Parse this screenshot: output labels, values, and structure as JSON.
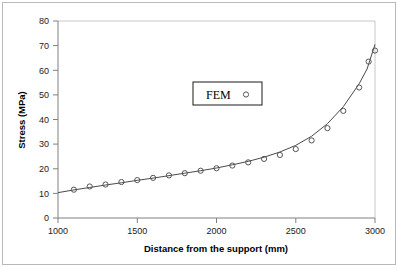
{
  "chart_data": {
    "type": "scatter",
    "title": "",
    "xlabel": "Distance from the support (mm)",
    "ylabel": "Stress (MPa)",
    "xlim": [
      1000,
      3000
    ],
    "ylim": [
      0,
      80
    ],
    "xticks": [
      1000,
      1500,
      2000,
      2500,
      3000
    ],
    "yticks": [
      0,
      10,
      20,
      30,
      40,
      50,
      60,
      70,
      80
    ],
    "xtick_labels": [
      "1000",
      "1500",
      "2000",
      "2500",
      "3000"
    ],
    "ytick_labels": [
      "0",
      "10",
      "20",
      "30",
      "40",
      "50",
      "60",
      "70",
      "80"
    ],
    "grid": false,
    "legend": {
      "position": "upper-center",
      "entries": [
        {
          "label": "FEM",
          "marker": "open-circle"
        }
      ]
    },
    "series": [
      {
        "name": "FEM",
        "marker": "open-circle",
        "x": [
          1100,
          1200,
          1300,
          1400,
          1500,
          1600,
          1700,
          1800,
          1900,
          2000,
          2100,
          2200,
          2300,
          2400,
          2500,
          2600,
          2700,
          2800,
          2900,
          2960,
          3000
        ],
        "y": [
          11.5,
          12.8,
          13.6,
          14.6,
          15.4,
          16.3,
          17.3,
          18.2,
          19.2,
          20.2,
          21.3,
          22.6,
          24.0,
          25.6,
          28.0,
          31.5,
          36.5,
          43.5,
          53.0,
          63.5,
          68.0
        ]
      },
      {
        "name": "fitted-curve",
        "marker": "none",
        "x": [
          1000,
          1100,
          1200,
          1300,
          1400,
          1500,
          1600,
          1700,
          1800,
          1900,
          2000,
          2100,
          2200,
          2300,
          2400,
          2500,
          2600,
          2700,
          2800,
          2900,
          2950,
          3000
        ],
        "y": [
          10.3,
          11.4,
          12.4,
          13.4,
          14.3,
          15.3,
          16.2,
          17.2,
          18.2,
          19.2,
          20.3,
          21.6,
          23.0,
          24.7,
          26.8,
          29.5,
          33.2,
          38.3,
          45.2,
          54.5,
          60.5,
          70.5
        ]
      }
    ]
  },
  "axes": {
    "x_label": "Distance from the support (mm)",
    "y_label": "Stress (MPa)"
  },
  "legend": {
    "label": "FEM",
    "marker_symbol": "○"
  },
  "colors": {
    "axis": "#808080",
    "curve": "#404040",
    "marker_stroke": "#555555",
    "frame": "#b9b9b9",
    "text": "#1a1a1a"
  }
}
